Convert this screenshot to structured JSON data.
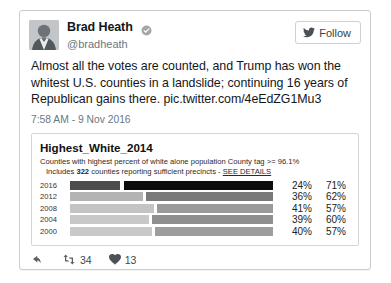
{
  "tweet": {
    "display_name": "Brad Heath",
    "verified_icon": "verified-badge-icon",
    "handle": "@bradheath",
    "follow_label": "Follow",
    "follow_icon": "twitter-bird-icon",
    "avatar_icon": "user-avatar",
    "text_line1": "Almost all the votes are counted, and Trump has won the whitest",
    "text_line2": "U.S. counties in a landslide; continuing 16 years of Republican",
    "text_line3": "gains there.",
    "link": "pic.twitter.com/4eEdZG1Mu3",
    "timestamp": "7:58 AM - 9 Nov 2016",
    "actions": {
      "reply_icon": "reply-arrow-icon",
      "retweet_icon": "retweet-icon",
      "retweet_count": "34",
      "like_icon": "heart-icon",
      "like_count": "13"
    }
  },
  "chart_data": {
    "type": "bar",
    "title": "Highest_White_2014",
    "subtitle": "Counties with highest percent of white alone population  County tag >= 96.1%",
    "subtitle2_prefix": "Includes ",
    "subtitle2_count": "322",
    "subtitle2_suffix": " counties reporting sufficient precincts - ",
    "see_details_label": "SEE DETAILS",
    "categories": [
      "2016",
      "2012",
      "2008",
      "2004",
      "2000"
    ],
    "columns": [
      "dem_pct",
      "gop_pct"
    ],
    "series": [
      {
        "name": "Democratic",
        "values": [
          24,
          36,
          41,
          39,
          40
        ]
      },
      {
        "name": "Republican",
        "values": [
          71,
          62,
          57,
          60,
          57
        ]
      }
    ],
    "rows": [
      {
        "year": "2016",
        "left_pct": "24%",
        "right_pct": "71%",
        "left_width": 24,
        "right_width": 71,
        "left_color": "#4c4c4c",
        "right_color": "#0d0d0d"
      },
      {
        "year": "2012",
        "left_pct": "36%",
        "right_pct": "62%",
        "left_width": 36,
        "right_width": 62,
        "left_color": "#b3b3b3",
        "right_color": "#7a7a7a"
      },
      {
        "year": "2008",
        "left_pct": "41%",
        "right_pct": "57%",
        "left_width": 41,
        "right_width": 57,
        "left_color": "#c4c4c4",
        "right_color": "#9a9a9a"
      },
      {
        "year": "2004",
        "left_pct": "39%",
        "right_pct": "60%",
        "left_width": 39,
        "right_width": 60,
        "left_color": "#c8c8c8",
        "right_color": "#8f8f8f"
      },
      {
        "year": "2000",
        "left_pct": "40%",
        "right_pct": "57%",
        "left_width": 40,
        "right_width": 57,
        "left_color": "#c9c9c9",
        "right_color": "#9d9d9d"
      }
    ],
    "xlabel": "",
    "ylabel": "",
    "grid": false,
    "legend": "none"
  }
}
